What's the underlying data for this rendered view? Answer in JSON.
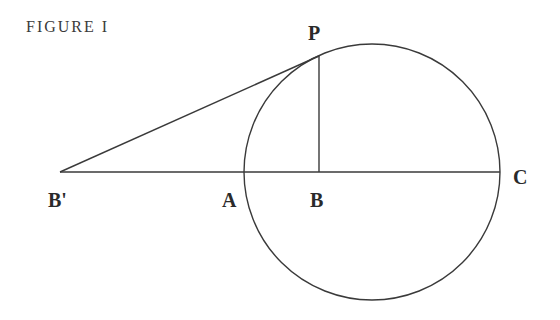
{
  "caption": "FIGURE I",
  "labels": {
    "P": "P",
    "B_prime": "B'",
    "A": "A",
    "B": "B",
    "C": "C"
  },
  "geometry": {
    "circle": {
      "cx": 372,
      "cy": 172,
      "r": 128
    },
    "points": {
      "B_prime": [
        60,
        172
      ],
      "A": [
        244,
        172
      ],
      "B": [
        319,
        172
      ],
      "C": [
        500,
        172
      ],
      "P": [
        319,
        56
      ]
    },
    "stroke_color": "#3a3a3a"
  }
}
